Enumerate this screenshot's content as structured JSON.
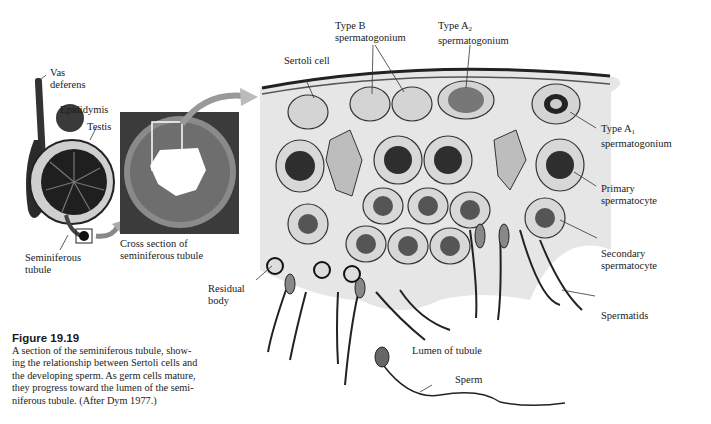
{
  "figure": {
    "title": "Figure 19.19",
    "caption_lines": [
      "A section of the seminiferous tubule, show-",
      "ing the relationship between Sertoli cells and",
      "the developing sperm. As germ cells mature,",
      "they progress toward the lumen of the semi-",
      "niferous tubule. (After Dym 1977.)"
    ]
  },
  "labels": {
    "vas_deferens": [
      "Vas",
      "deferens"
    ],
    "epididymis": "Epididymis",
    "testis": "Testis",
    "seminiferous_tubule": [
      "Seminiferous",
      "tubule"
    ],
    "cross_section": [
      "Cross section of",
      "seminiferous tubule"
    ],
    "sertoli_cell": "Sertoli cell",
    "type_b": [
      "Type B",
      "spermatogonium"
    ],
    "type_a2": {
      "line1": "Type A",
      "sub": "2",
      "line2": "spermatogonium"
    },
    "type_a1": {
      "line1": "Type A",
      "sub": "1",
      "line2": "spermatogonium"
    },
    "primary_spermatocyte": [
      "Primary",
      "spermatocyte"
    ],
    "secondary_spermatocyte": [
      "Secondary",
      "spermatocyte"
    ],
    "spermatids": "Spermatids",
    "residual_body": [
      "Residual",
      "body"
    ],
    "lumen": "Lumen of tubule",
    "sperm": "Sperm"
  }
}
